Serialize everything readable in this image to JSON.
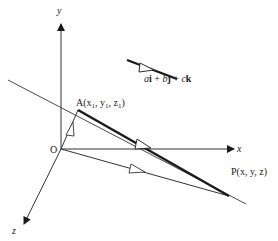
{
  "diagram": {
    "type": "3d-vector-line",
    "axes": {
      "x_label": "x",
      "y_label": "y",
      "z_label": "z"
    },
    "origin_label": "O",
    "points": {
      "A": {
        "label": "A(x",
        "sub1": "1",
        "sep1": ", y",
        "sub2": "1",
        "sep2": ", z",
        "sub3": "1",
        "close": ")"
      },
      "P": {
        "label": "P(x, y, z)"
      }
    },
    "direction_vector": {
      "a": "a",
      "i": "i",
      "plus1": " + ",
      "b": "b",
      "j": "j",
      "plus2": " + ",
      "c": "c",
      "k": "k"
    },
    "colors": {
      "line": "#1a1a1a",
      "thin_line": "#333333",
      "background": "#ffffff"
    }
  }
}
